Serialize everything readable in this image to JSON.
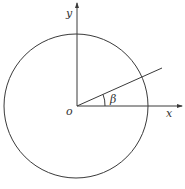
{
  "diagram": {
    "type": "polar-coordinate-circle",
    "colors": {
      "background": "#ffffff",
      "stroke": "#3a3a3a",
      "label": "#333333"
    },
    "labels": {
      "y_axis": "y",
      "x_axis": "x",
      "origin": "o",
      "angle": "β"
    },
    "geometry": {
      "origin": [
        77,
        106
      ],
      "circle_radius": 72,
      "ray_end": [
        162,
        68
      ],
      "x_axis_end": [
        182,
        106
      ],
      "y_axis_end": [
        77,
        2
      ]
    }
  }
}
